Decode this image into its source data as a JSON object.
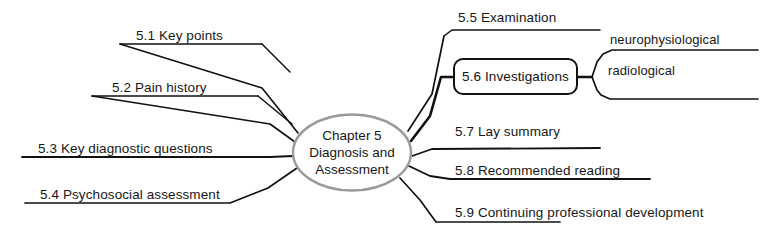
{
  "diagram": {
    "type": "mind-map",
    "background_color": "#ffffff",
    "line_color": "#111111",
    "text_color": "#171717",
    "center": {
      "line1": "Chapter 5",
      "line2": "Diagnosis and",
      "line3": "Assessment",
      "shape": "ellipse"
    },
    "branches_left": [
      {
        "label": "5.1 Key points"
      },
      {
        "label": "5.2 Pain history"
      },
      {
        "label": "5.3 Key diagnostic questions"
      },
      {
        "label": "5.4 Psychosocial assessment"
      }
    ],
    "branches_right": [
      {
        "label": "5.5 Examination"
      },
      {
        "label": "5.6 Investigations",
        "shape": "rounded-rectangle"
      },
      {
        "label": "5.7 Lay summary"
      },
      {
        "label": "5.8 Recommended reading"
      },
      {
        "label": "5.9 Continuing professional development"
      }
    ],
    "sub_branches": [
      {
        "label": "neurophysiological",
        "parent": "5.6 Investigations"
      },
      {
        "label": "radiological",
        "parent": "5.6 Investigations"
      }
    ]
  }
}
